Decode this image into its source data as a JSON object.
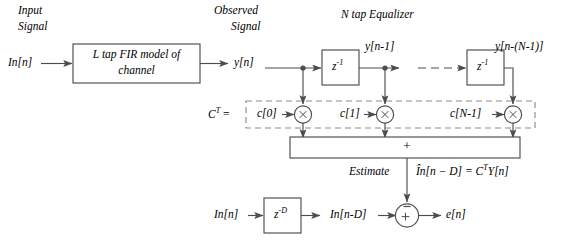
{
  "figure": {
    "type": "block-diagram",
    "title_labels": {
      "input_signal": "Input\nSignal",
      "input_signal_line1": "Input",
      "input_signal_line2": "Signal",
      "observed_signal_line1": "Observed",
      "observed_signal_line2": "Signal",
      "equalizer": "N tap Equalizer"
    },
    "blocks": [
      {
        "name": "fir-channel-block",
        "text": "L tap FIR model of channel",
        "line1": "L tap FIR model of",
        "line2": "channel"
      },
      {
        "name": "delay-block-1",
        "text": "z-1",
        "base": "z",
        "exp": "-1"
      },
      {
        "name": "delay-block-n",
        "text": "z-1",
        "base": "z",
        "exp": "-1"
      },
      {
        "name": "delay-block-d",
        "text": "z-D",
        "base": "z",
        "exp": "-D"
      },
      {
        "name": "summation-block",
        "text": "+"
      }
    ],
    "signals": {
      "input": "In[n]",
      "observed": "y[n]",
      "delayed_1": "y[n-1]",
      "delayed_n": "y[n-(N-1)]",
      "input_delayed": "In[n-D]",
      "error": "e[n]",
      "estimate_label": "Estimate",
      "estimate_expr": "Ȋn[n − D] = C T Y[n]",
      "estimate_expr_parts": {
        "hat": "În[n − D] = ",
        "ct": "C",
        "t": "T",
        "y": "Y[n]"
      }
    },
    "coefficients": {
      "vector_label": "C T =",
      "vector_label_parts": {
        "c": "C",
        "t": "T",
        "eq": "="
      },
      "taps": [
        "c[0]",
        "c[1]",
        "c[N-1]"
      ]
    },
    "operators": {
      "multiply": "×",
      "sum": "+",
      "adder_plus": "+",
      "adder_minus": "−"
    },
    "colors": {
      "line": "#4d4d4d",
      "dashed_box": "#8c8c8c",
      "text": "#000000",
      "background": "#ffffff"
    }
  }
}
